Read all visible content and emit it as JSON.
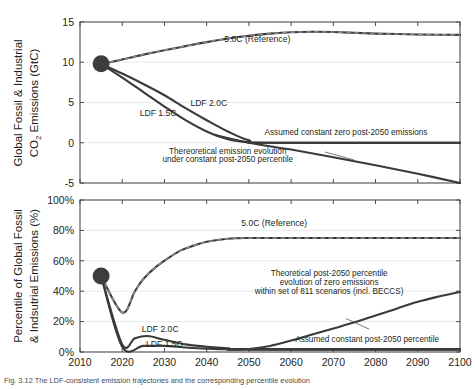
{
  "figure": {
    "caption": "Fig. 3.12 The LDF-consistent emission trajectories and the corresponding percentile evolution"
  },
  "chart_data": [
    {
      "type": "line",
      "panel": "top",
      "title": "",
      "xlabel": "",
      "ylabel": "Global Fossil & Industrial CO2 Emissions (GtC)",
      "ylabel_line1": "Global Fossil & Industrial",
      "ylabel_line2_pre": "CO",
      "ylabel_line2_sub": "2",
      "ylabel_line2_post": " Emissions (GtC)",
      "xlim": [
        2010,
        2100
      ],
      "ylim": [
        -5,
        15
      ],
      "xticks": [
        2010,
        2020,
        2030,
        2040,
        2050,
        2060,
        2070,
        2080,
        2090,
        2100
      ],
      "xticklabels": [
        "2010",
        "2020",
        "2030",
        "2040",
        "2050",
        "2060",
        "2070",
        "2080",
        "2090",
        "2100"
      ],
      "yticks": [
        -5,
        0,
        5,
        10,
        15
      ],
      "yticklabels": [
        "-5",
        "0",
        "5",
        "10",
        "15"
      ],
      "grid": true,
      "marker_point": {
        "x": 2015,
        "y": 9.8,
        "label": "start-marker"
      },
      "annotations": [
        {
          "name": "reference-label",
          "text": "5.0C (Reference)",
          "x": 2052,
          "y": 12.55
        },
        {
          "name": "ldf15-label",
          "text": "LDF 1.5C",
          "x": 2028.5,
          "y": 3.35
        },
        {
          "name": "ldf20-label",
          "text": "LDF 2.0C",
          "x": 2040.5,
          "y": 4.6
        },
        {
          "name": "zero-emissions-label",
          "text": "Assumed constant zero post-2050 emissions",
          "x": 2073,
          "y": 0.95
        },
        {
          "name": "theoretical-evolution-label-line1",
          "text": "Thereoretical emission evolution",
          "x": 2045,
          "y": -1.45
        },
        {
          "name": "theoretical-evolution-label-line2",
          "text": "under constant post-2050 percentile",
          "x": 2045,
          "y": -2.45
        }
      ],
      "series": [
        {
          "name": "5.0C (Reference)",
          "style": "solid-dark-with-gray-dash-overlay",
          "x": [
            2015,
            2020,
            2025,
            2030,
            2035,
            2040,
            2045,
            2050,
            2055,
            2060,
            2065,
            2070,
            2075,
            2080,
            2085,
            2090,
            2095,
            2100
          ],
          "values": [
            9.8,
            10.35,
            10.95,
            11.5,
            12.0,
            12.5,
            12.95,
            13.3,
            13.55,
            13.72,
            13.78,
            13.75,
            13.66,
            13.56,
            13.5,
            13.45,
            13.42,
            13.4
          ]
        },
        {
          "name": "LDF 2.0C",
          "style": "solid-dark",
          "x": [
            2015,
            2020,
            2025,
            2030,
            2035,
            2040,
            2045,
            2050,
            2055,
            2100
          ],
          "values": [
            9.8,
            8.6,
            7.3,
            5.9,
            4.3,
            2.8,
            1.4,
            0.3,
            0.0,
            0.0
          ]
        },
        {
          "name": "LDF 1.5C",
          "style": "solid-dark",
          "x": [
            2015,
            2020,
            2025,
            2030,
            2035,
            2040,
            2045,
            2050,
            2055,
            2100
          ],
          "values": [
            9.8,
            8.1,
            6.3,
            4.5,
            2.8,
            1.4,
            0.45,
            0.05,
            0.0,
            0.0
          ]
        },
        {
          "name": "Assumed constant zero post-2050 emissions",
          "style": "solid-dark-flat",
          "x": [
            2050,
            2100
          ],
          "values": [
            0.0,
            0.0
          ]
        },
        {
          "name": "Thereoretical emission evolution under constant post-2050 percentile",
          "style": "solid-dark",
          "x": [
            2042,
            2050,
            2060,
            2070,
            2080,
            2090,
            2100
          ],
          "values": [
            0.95,
            0.0,
            -0.85,
            -1.8,
            -2.8,
            -3.85,
            -5.0
          ]
        }
      ]
    },
    {
      "type": "line",
      "panel": "bottom",
      "title": "",
      "xlabel": "",
      "ylabel": "Percentile of Global Fossil & Indsutrial Emissions (%)",
      "ylabel_line1": "Percentile of Global Fossil",
      "ylabel_line2": "& Indsutrial Emissions (%)",
      "xlim": [
        2010,
        2100
      ],
      "ylim": [
        0,
        100
      ],
      "xticks": [
        2010,
        2020,
        2030,
        2040,
        2050,
        2060,
        2070,
        2080,
        2090,
        2100
      ],
      "xticklabels": [
        "2010",
        "2020",
        "2030",
        "2040",
        "2050",
        "2060",
        "2070",
        "2080",
        "2090",
        "2100"
      ],
      "yticks": [
        0,
        20,
        40,
        60,
        80,
        100
      ],
      "yticklabels": [
        "0%",
        "20%",
        "40%",
        "60%",
        "80%",
        "100%"
      ],
      "grid": true,
      "marker_point": {
        "x": 2015,
        "y": 50,
        "label": "start-marker"
      },
      "annotations": [
        {
          "name": "reference-label",
          "text": "5.0C (Reference)",
          "x": 2056,
          "y": 83
        },
        {
          "name": "ldf20-label",
          "text": "LDF 2.0C",
          "x": 2029,
          "y": 13
        },
        {
          "name": "ldf15-label",
          "text": "LDF 1.5C",
          "x": 2030,
          "y": 3.5
        },
        {
          "name": "theoretical-percentile-label-line1",
          "text": "Theoretical post-2050 percentile",
          "x": 2069,
          "y": 50
        },
        {
          "name": "theoretical-percentile-label-line2",
          "text": "evolution of zero emissions",
          "x": 2069,
          "y": 44
        },
        {
          "name": "theoretical-percentile-label-line3",
          "text": "within set of 811 scenarios (incl. BECCS)",
          "x": 2069,
          "y": 38
        },
        {
          "name": "constant-percentile-label",
          "text": "Assumed constant post-2050 percentile",
          "x": 2078,
          "y": 6.5
        }
      ],
      "series": [
        {
          "name": "5.0C (Reference)",
          "style": "solid-dark-with-gray-dash-overlay",
          "x": [
            2015,
            2020,
            2023,
            2025,
            2028,
            2031,
            2034,
            2037,
            2040,
            2045,
            2050,
            2060,
            2070,
            2080,
            2090,
            2100
          ],
          "values": [
            50,
            26,
            40,
            48,
            56,
            62,
            67,
            70,
            72.5,
            74.5,
            75,
            75,
            75,
            75,
            75,
            75
          ]
        },
        {
          "name": "LDF 2.0C",
          "style": "solid-dark",
          "x": [
            2015,
            2020,
            2023,
            2026,
            2030,
            2035,
            2040,
            2045,
            2050,
            2100
          ],
          "values": [
            50,
            5,
            9,
            10.5,
            8,
            5,
            3.5,
            2.5,
            2,
            2
          ]
        },
        {
          "name": "LDF 1.5C",
          "style": "solid-dark",
          "x": [
            2015,
            2020,
            2025,
            2030,
            2035,
            2040,
            2045,
            2050,
            2100
          ],
          "values": [
            50,
            3.5,
            4,
            4,
            3,
            2.2,
            1.8,
            1.5,
            1.5
          ]
        },
        {
          "name": "Assumed constant post-2050 percentile",
          "style": "solid-dark-flat",
          "x": [
            2050,
            2100
          ],
          "values": [
            1.5,
            1.5
          ]
        },
        {
          "name": "Theoretical post-2050 percentile evolution of zero emissions within set of 811 scenarios (incl. BECCS)",
          "style": "solid-dark",
          "x": [
            2045,
            2050,
            2055,
            2060,
            2065,
            2070,
            2075,
            2080,
            2085,
            2090,
            2095,
            2100
          ],
          "values": [
            1.5,
            2,
            4,
            7.5,
            11.5,
            15.5,
            19.5,
            24,
            28.5,
            33,
            36.5,
            39.5
          ]
        }
      ]
    }
  ]
}
